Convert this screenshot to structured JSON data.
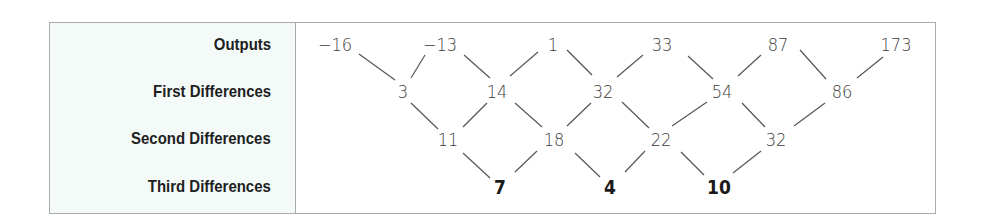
{
  "labels": {
    "outputs": "Outputs",
    "first": "First Differences",
    "second": "Second Differences",
    "third": "Third Differences"
  },
  "rows": {
    "outputs": [
      {
        "text": "−16",
        "x": 335,
        "y": 45
      },
      {
        "text": "−13",
        "x": 440,
        "y": 45
      },
      {
        "text": "1",
        "x": 553,
        "y": 45
      },
      {
        "text": "33",
        "x": 662,
        "y": 45
      },
      {
        "text": "87",
        "x": 778,
        "y": 45
      },
      {
        "text": "173",
        "x": 896,
        "y": 45
      }
    ],
    "first": [
      {
        "text": "3",
        "x": 403,
        "y": 92
      },
      {
        "text": "14",
        "x": 497,
        "y": 92
      },
      {
        "text": "32",
        "x": 603,
        "y": 92
      },
      {
        "text": "54",
        "x": 722,
        "y": 92
      },
      {
        "text": "86",
        "x": 842,
        "y": 92
      }
    ],
    "second": [
      {
        "text": "11",
        "x": 448,
        "y": 140
      },
      {
        "text": "18",
        "x": 554,
        "y": 140
      },
      {
        "text": "22",
        "x": 661,
        "y": 140
      },
      {
        "text": "32",
        "x": 776,
        "y": 140
      }
    ],
    "third": [
      {
        "text": "7",
        "x": 500,
        "y": 187
      },
      {
        "text": "4",
        "x": 610,
        "y": 187
      },
      {
        "text": "10",
        "x": 719,
        "y": 187
      }
    ]
  },
  "connectors": [
    [
      359,
      54,
      395,
      80
    ],
    [
      425,
      55,
      411,
      78
    ],
    [
      464,
      55,
      490,
      78
    ],
    [
      538,
      52,
      510,
      76
    ],
    [
      567,
      50,
      592,
      75
    ],
    [
      643,
      55,
      617,
      77
    ],
    [
      688,
      56,
      713,
      79
    ],
    [
      761,
      55,
      738,
      76
    ],
    [
      800,
      50,
      826,
      79
    ],
    [
      883,
      57,
      857,
      78
    ],
    [
      411,
      103,
      438,
      129
    ],
    [
      487,
      103,
      463,
      127
    ],
    [
      515,
      103,
      542,
      127
    ],
    [
      591,
      103,
      567,
      126
    ],
    [
      622,
      102,
      649,
      128
    ],
    [
      707,
      102,
      672,
      126
    ],
    [
      742,
      103,
      765,
      127
    ],
    [
      825,
      103,
      794,
      126
    ],
    [
      463,
      153,
      490,
      178
    ],
    [
      537,
      151,
      515,
      172
    ],
    [
      575,
      153,
      600,
      177
    ],
    [
      645,
      151,
      625,
      172
    ],
    [
      681,
      152,
      704,
      175
    ],
    [
      761,
      151,
      733,
      173
    ]
  ],
  "colors": {
    "label_bg": "#f3faf7",
    "border": "#a9aaa9",
    "line": "#555555"
  }
}
